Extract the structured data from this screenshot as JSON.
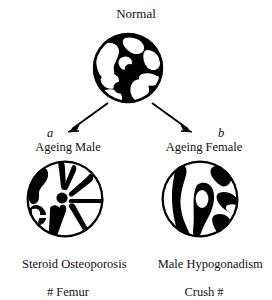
{
  "figure": {
    "type": "diagram",
    "background_color": "#ffffff",
    "ink_color": "#000000"
  },
  "top_node": {
    "title": "Normal",
    "icon_name": "bone-cross-section-normal"
  },
  "branches": [
    {
      "letter": "a",
      "arrow_name": "arrow-to-ageing-male",
      "heading": "Ageing Male",
      "icon_name": "bone-cross-section-ageing-male",
      "caption_line1": "Steroid Osteoporosis",
      "caption_line2": "# Femur"
    },
    {
      "letter": "b",
      "arrow_name": "arrow-to-ageing-female",
      "heading": "Ageing Female",
      "icon_name": "bone-cross-section-ageing-female",
      "caption_line1": "Male Hypogonadism",
      "caption_line2": "Crush #"
    }
  ]
}
